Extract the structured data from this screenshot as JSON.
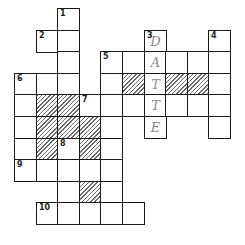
{
  "puzzle": {
    "type": "crossword",
    "grid_origin": {
      "x": 14,
      "y": 8
    },
    "cell_size": 21.6,
    "cells": [
      {
        "r": 0,
        "c": 2,
        "num": "1"
      },
      {
        "r": 1,
        "c": 1,
        "num": "2"
      },
      {
        "r": 1,
        "c": 2
      },
      {
        "r": 1,
        "c": 6,
        "num": "3",
        "letter": "D"
      },
      {
        "r": 1,
        "c": 9,
        "num": "4"
      },
      {
        "r": 2,
        "c": 2
      },
      {
        "r": 2,
        "c": 4,
        "num": "5"
      },
      {
        "r": 2,
        "c": 5
      },
      {
        "r": 2,
        "c": 6,
        "letter": "A"
      },
      {
        "r": 2,
        "c": 7
      },
      {
        "r": 2,
        "c": 8
      },
      {
        "r": 2,
        "c": 9
      },
      {
        "r": 3,
        "c": 0,
        "num": "6"
      },
      {
        "r": 3,
        "c": 1
      },
      {
        "r": 3,
        "c": 2
      },
      {
        "r": 3,
        "c": 4
      },
      {
        "r": 3,
        "c": 5,
        "shaded": true
      },
      {
        "r": 3,
        "c": 6,
        "letter": "T"
      },
      {
        "r": 3,
        "c": 7,
        "shaded": true
      },
      {
        "r": 3,
        "c": 8,
        "shaded": true
      },
      {
        "r": 3,
        "c": 9
      },
      {
        "r": 4,
        "c": 0
      },
      {
        "r": 4,
        "c": 1,
        "shaded": true
      },
      {
        "r": 4,
        "c": 2,
        "shaded": true
      },
      {
        "r": 4,
        "c": 3,
        "num": "7"
      },
      {
        "r": 4,
        "c": 4
      },
      {
        "r": 4,
        "c": 5
      },
      {
        "r": 4,
        "c": 6,
        "letter": "T"
      },
      {
        "r": 4,
        "c": 7
      },
      {
        "r": 4,
        "c": 8
      },
      {
        "r": 4,
        "c": 9
      },
      {
        "r": 5,
        "c": 0
      },
      {
        "r": 5,
        "c": 1,
        "shaded": true
      },
      {
        "r": 5,
        "c": 2,
        "shaded": true
      },
      {
        "r": 5,
        "c": 3,
        "shaded": true
      },
      {
        "r": 5,
        "c": 4
      },
      {
        "r": 5,
        "c": 6,
        "letter": "E"
      },
      {
        "r": 5,
        "c": 9
      },
      {
        "r": 6,
        "c": 0
      },
      {
        "r": 6,
        "c": 1,
        "shaded": true
      },
      {
        "r": 6,
        "c": 2,
        "num": "8"
      },
      {
        "r": 6,
        "c": 3,
        "shaded": true
      },
      {
        "r": 6,
        "c": 4
      },
      {
        "r": 7,
        "c": 0,
        "num": "9"
      },
      {
        "r": 7,
        "c": 1
      },
      {
        "r": 7,
        "c": 2
      },
      {
        "r": 7,
        "c": 3
      },
      {
        "r": 7,
        "c": 4
      },
      {
        "r": 8,
        "c": 2
      },
      {
        "r": 8,
        "c": 3,
        "shaded": true
      },
      {
        "r": 8,
        "c": 4
      },
      {
        "r": 9,
        "c": 1,
        "num": "10"
      },
      {
        "r": 9,
        "c": 2
      },
      {
        "r": 9,
        "c": 3
      },
      {
        "r": 9,
        "c": 4
      },
      {
        "r": 9,
        "c": 5
      }
    ],
    "entered_word": {
      "number": "3",
      "direction": "down",
      "letters": "DATTE"
    }
  }
}
